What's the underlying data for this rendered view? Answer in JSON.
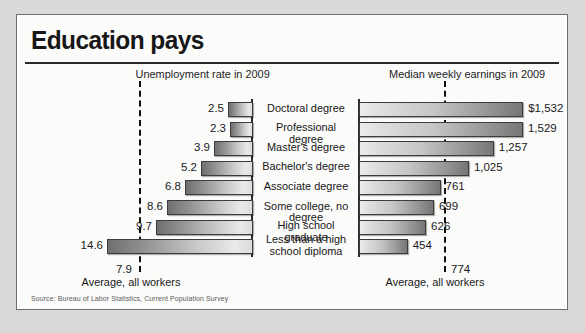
{
  "title": "Education pays",
  "source": "Source: Bureau of Labor Statistics, Current Population Survey",
  "headers": {
    "left": "Unemployment rate in 2009",
    "right": "Median weekly earnings in 2009"
  },
  "averages": {
    "left_value": "7.9",
    "left_label": "Average, all workers",
    "right_value": "774",
    "right_label": "Average, all workers"
  },
  "rows": [
    {
      "category": "Doctoral degree",
      "unemployment": "2.5",
      "earnings": "$1,532"
    },
    {
      "category": "Professional degree",
      "unemployment": "2.3",
      "earnings": "1,529"
    },
    {
      "category": "Master's degree",
      "unemployment": "3.9",
      "earnings": "1,257"
    },
    {
      "category": "Bachelor's degree",
      "unemployment": "5.2",
      "earnings": "1,025"
    },
    {
      "category": "Associate degree",
      "unemployment": "6.8",
      "earnings": "761"
    },
    {
      "category": "Some college, no degree",
      "unemployment": "8.6",
      "earnings": "699"
    },
    {
      "category": "High school graduate",
      "unemployment": "9.7",
      "earnings": "626"
    },
    {
      "category": "Less than a high\nschool diploma",
      "unemployment": "14.6",
      "earnings": "454"
    }
  ],
  "chart_data": {
    "type": "bar",
    "title": "Education pays",
    "orientation": "horizontal",
    "panels": [
      {
        "name": "unemployment",
        "title": "Unemployment rate in 2009",
        "direction": "right-to-left",
        "unit": "percent",
        "categories": [
          "Doctoral degree",
          "Professional degree",
          "Master's degree",
          "Bachelor's degree",
          "Associate degree",
          "Some college, no degree",
          "High school graduate",
          "Less than a high school diploma"
        ],
        "values": [
          2.5,
          2.3,
          3.9,
          5.2,
          6.8,
          8.6,
          9.7,
          14.6
        ],
        "reference_line": {
          "label": "Average, all workers",
          "value": 7.9
        },
        "xlim": [
          0,
          16
        ],
        "grid": false
      },
      {
        "name": "earnings",
        "title": "Median weekly earnings in 2009",
        "direction": "left-to-right",
        "unit": "US dollars per week",
        "categories": [
          "Doctoral degree",
          "Professional degree",
          "Master's degree",
          "Bachelor's degree",
          "Associate degree",
          "Some college, no degree",
          "High school graduate",
          "Less than a high school diploma"
        ],
        "values": [
          1532,
          1529,
          1257,
          1025,
          761,
          699,
          626,
          454
        ],
        "value_labels": [
          "$1,532",
          "1,529",
          "1,257",
          "1,025",
          "761",
          "699",
          "626",
          "454"
        ],
        "reference_line": {
          "label": "Average, all workers",
          "value": 774
        },
        "xlim": [
          0,
          1700
        ],
        "grid": false
      }
    ],
    "legend": null,
    "source": "Source: Bureau of Labor Statistics, Current Population Survey"
  },
  "geometry": {
    "row_top": 86,
    "row_step": 19.6,
    "left_baseline_x": 234,
    "left_px_per_unit": 10.0,
    "right_baseline_x": 343,
    "right_px_per_unit": 0.1072
  }
}
